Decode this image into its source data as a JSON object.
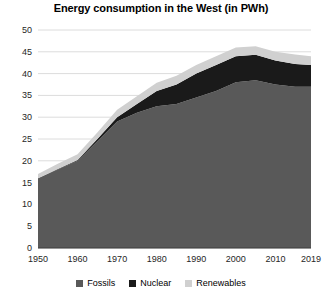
{
  "chart_data": {
    "type": "area",
    "stacked": true,
    "title": "Energy consumption in the West (in PWh)",
    "xlabel": "",
    "ylabel": "",
    "ylim": [
      0,
      50
    ],
    "xlim": [
      1950,
      2019
    ],
    "grid": true,
    "grid_axis": "y",
    "legend_position": "bottom",
    "ytick_labels": [
      "0",
      "5",
      "10",
      "15",
      "20",
      "25",
      "30",
      "35",
      "40",
      "45",
      "50"
    ],
    "ytick_values": [
      0,
      5,
      10,
      15,
      20,
      25,
      30,
      35,
      40,
      45,
      50
    ],
    "xtick_labels": [
      "1950",
      "1960",
      "1970",
      "1980",
      "1990",
      "2000",
      "2010",
      "2019"
    ],
    "xtick_values": [
      1950,
      1960,
      1970,
      1980,
      1990,
      2000,
      2010,
      2019
    ],
    "x": [
      1950,
      1955,
      1960,
      1965,
      1970,
      1975,
      1980,
      1985,
      1990,
      1995,
      2000,
      2005,
      2010,
      2015,
      2019
    ],
    "series": [
      {
        "name": "Fossils",
        "color": "#595959",
        "values": [
          16.0,
          18.0,
          20.0,
          24.5,
          29.0,
          31.0,
          32.5,
          33.0,
          34.5,
          36.0,
          38.0,
          38.5,
          37.5,
          37.0,
          37.0
        ]
      },
      {
        "name": "Nuclear",
        "color": "#1A1A1A",
        "values": [
          0.0,
          0.1,
          0.2,
          0.5,
          1.0,
          2.0,
          3.5,
          4.5,
          5.5,
          6.0,
          6.0,
          5.8,
          5.5,
          5.2,
          5.0
        ]
      },
      {
        "name": "Renewables",
        "color": "#D0D0D0",
        "values": [
          1.0,
          1.2,
          1.3,
          1.5,
          1.7,
          1.8,
          1.9,
          2.0,
          2.0,
          2.0,
          2.0,
          2.0,
          2.0,
          2.2,
          2.0
        ]
      }
    ],
    "totals": [
      17.0,
      19.3,
      21.5,
      26.5,
      31.7,
      34.8,
      37.9,
      39.5,
      42.0,
      44.0,
      46.0,
      46.3,
      45.0,
      44.4,
      44.0
    ],
    "colors": {
      "fossils": "#595959",
      "nuclear": "#1A1A1A",
      "renewables": "#D0D0D0",
      "gridline": "#DCDCDC",
      "text": "#000000",
      "background": "#FFFFFF"
    }
  },
  "legend": {
    "items": [
      {
        "label": "Fossils",
        "color": "#595959",
        "icon": "square-swatch-icon"
      },
      {
        "label": "Nuclear",
        "color": "#1A1A1A",
        "icon": "square-swatch-icon"
      },
      {
        "label": "Renewables",
        "color": "#D0D0D0",
        "icon": "square-swatch-icon"
      }
    ]
  }
}
